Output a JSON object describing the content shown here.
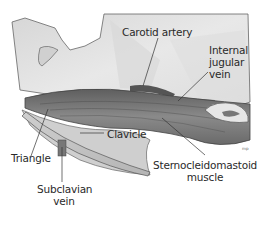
{
  "diagram": {
    "labels": {
      "carotid_artery": "Carotid artery",
      "internal_jugular_line1": "Internal",
      "internal_jugular_line2": "jugular",
      "internal_jugular_line3": "vein",
      "triangle": "Triangle",
      "clavicle": "Clavicle",
      "subclavian_line1": "Subclavian",
      "subclavian_line2": "vein",
      "scm_line1": "Sternocleidomastoid",
      "scm_line2": "muscle"
    },
    "artist_signature": "mp",
    "colors": {
      "background": "#ffffff",
      "skin_light": "#e4e4e4",
      "skin_mid": "#c8c8c8",
      "muscle_dark": "#6e6e6e",
      "muscle_mid": "#8c8c8c",
      "outline": "#555555",
      "leader_line": "#333333",
      "text": "#2a2a2a"
    }
  }
}
